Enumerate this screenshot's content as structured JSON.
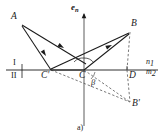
{
  "figure": {
    "caption": "a)",
    "normal_vector_label": "e",
    "normal_vector_subscript": "n",
    "region_upper_label": "I",
    "region_lower_label": "II",
    "medium_upper_label": "n",
    "medium_upper_subscript": "1",
    "medium_lower_label": "m",
    "medium_lower_subscript": "2",
    "angle_label": "β",
    "colors": {
      "stroke": "#1a1a1a",
      "dashed": "#555555",
      "background": "#ffffff"
    },
    "points": [
      {
        "id": "A",
        "label": "A",
        "x": 20,
        "y": 22
      },
      {
        "id": "B",
        "label": "B",
        "x": 130,
        "y": 30
      },
      {
        "id": "C",
        "label": "C",
        "x": 84,
        "y": 70
      },
      {
        "id": "Cp",
        "label": "C'",
        "x": 50,
        "y": 70
      },
      {
        "id": "D",
        "label": "D",
        "x": 127,
        "y": 70
      },
      {
        "id": "Bp",
        "label": "B'",
        "x": 130,
        "y": 104
      }
    ],
    "solid_rays": [
      {
        "name": "ray-A-to-Cprime",
        "from": "A",
        "to": "Cp"
      },
      {
        "name": "ray-Cprime-to-C",
        "from": "Cp",
        "to": "C"
      },
      {
        "name": "ray-A-to-C",
        "from": "A",
        "to": "C"
      },
      {
        "name": "ray-C-to-B",
        "from": "C",
        "to": "B"
      },
      {
        "name": "ray-Cprime-to-B",
        "from": "Cp",
        "to": "B"
      }
    ],
    "dashed_lines": [
      {
        "name": "dashed-B-to-D",
        "from": "B",
        "to": "D"
      },
      {
        "name": "dashed-D-to-Bprime",
        "from": "D",
        "to": "Bp"
      },
      {
        "name": "dashed-C-to-Bprime",
        "from": "C",
        "to": "Bp"
      },
      {
        "name": "dashed-Cprime-to-Bprime",
        "from": "Cp",
        "to": "Bp"
      }
    ],
    "axis": {
      "name": "interface-line",
      "x1": 6,
      "x2": 158,
      "y": 70
    },
    "normal_axis": {
      "name": "normal-axis-line",
      "x": 84,
      "y1": 14,
      "y2": 126
    }
  }
}
